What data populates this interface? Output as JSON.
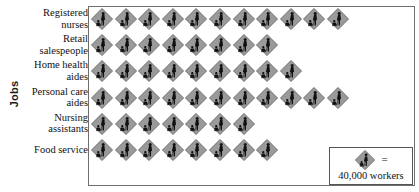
{
  "chart_data": {
    "type": "bar",
    "subtype": "pictograph",
    "title": "",
    "xlabel": "",
    "ylabel": "Jobs",
    "unit_value": 40000,
    "unit_label": "workers",
    "legend_equals": "=",
    "legend_caption": "40,000 workers",
    "icon_name": "worker-pictogram-icon",
    "grid": false,
    "legend_position": "bottom-right",
    "categories": [
      "Registered nurses",
      "Retail salespeople",
      "Home health aides",
      "Personal care aides",
      "Nursing assistants",
      "Food service"
    ],
    "icon_counts": [
      11,
      8,
      9,
      11,
      7,
      8
    ],
    "values": [
      440000,
      320000,
      360000,
      440000,
      280000,
      320000
    ]
  },
  "axis": {
    "y_title": "Jobs"
  },
  "categories": [
    {
      "label": "Registered nurses",
      "icons": 11,
      "value": 440000
    },
    {
      "label": "Retail salespeople",
      "icons": 8,
      "value": 320000
    },
    {
      "label": "Home health aides",
      "icons": 9,
      "value": 360000
    },
    {
      "label": "Personal care aides",
      "icons": 11,
      "value": 440000
    },
    {
      "label": "Nursing assistants",
      "icons": 7,
      "value": 280000
    },
    {
      "label": "Food service",
      "icons": 8,
      "value": 320000
    }
  ],
  "legend": {
    "equals": "=",
    "caption": "40,000 workers"
  },
  "colors": {
    "icon_fill": "#9a9a9a",
    "icon_stroke": "#6f6f6f",
    "figure": "#111111",
    "text": "#111111",
    "frame": "#6f6f6f",
    "background": "#ffffff"
  }
}
